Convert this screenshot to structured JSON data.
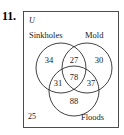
{
  "problem": {
    "number": "11."
  },
  "diagram": {
    "type": "venn-3-set",
    "universe_label": "U",
    "sets": [
      {
        "id": "sinkholes",
        "label": "Sinkholes"
      },
      {
        "id": "mold",
        "label": "Mold"
      },
      {
        "id": "floods",
        "label": "Floods"
      }
    ],
    "regions": [
      {
        "id": "sinkholes-only",
        "value": "34"
      },
      {
        "id": "sinkholes-mold",
        "value": "27"
      },
      {
        "id": "mold-only",
        "value": "30"
      },
      {
        "id": "sinkholes-floods",
        "value": "31"
      },
      {
        "id": "all-three",
        "value": "78"
      },
      {
        "id": "mold-floods",
        "value": "37"
      },
      {
        "id": "floods-only",
        "value": "88"
      },
      {
        "id": "outside-all",
        "value": "25"
      }
    ]
  }
}
